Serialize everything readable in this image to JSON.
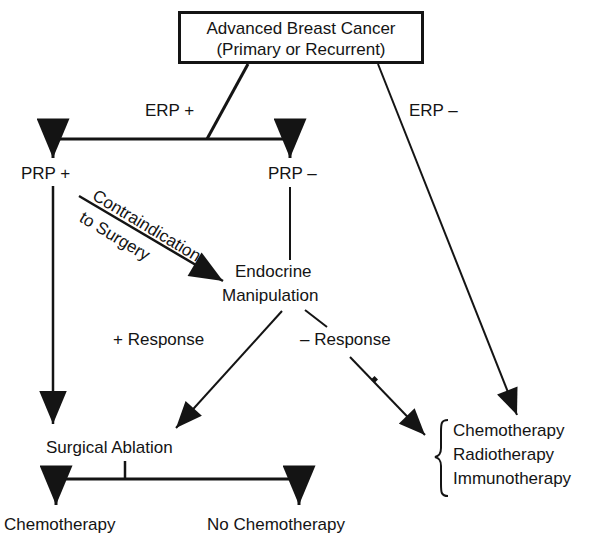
{
  "diagram": {
    "root": {
      "line1": "Advanced Breast Cancer",
      "line2": "(Primary or Recurrent)"
    },
    "edges": {
      "erp_pos": "ERP +",
      "erp_neg": "ERP –",
      "contra_line1": "Contraindication",
      "contra_line2": "to Surgery",
      "pos_response": "+  Response",
      "neg_response": "–  Response"
    },
    "nodes": {
      "prp_pos": "PRP +",
      "prp_neg": "PRP –",
      "endocrine_line1": "Endocrine",
      "endocrine_line2": "Manipulation",
      "surgical_ablation": "Surgical Ablation",
      "chemotherapy": "Chemotherapy",
      "no_chemotherapy": "No Chemotherapy",
      "therapies": [
        "Chemotherapy",
        "Radiotherapy",
        "Immunotherapy"
      ]
    },
    "colors": {
      "ink": "#141414",
      "background": "#ffffff"
    }
  }
}
